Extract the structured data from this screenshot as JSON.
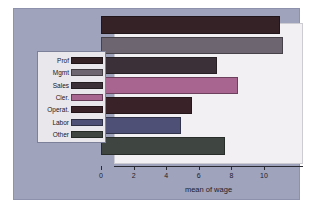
{
  "chart_data": {
    "type": "bar",
    "orientation": "horizontal",
    "title": "",
    "xlabel": "mean of wage",
    "ylabel": "",
    "xlim": [
      0,
      11.6
    ],
    "xticks": [
      0,
      2,
      4,
      6,
      8,
      10
    ],
    "xtick_labels": [
      "0",
      "2",
      "4",
      "6",
      "8",
      "10"
    ],
    "grid": false,
    "legend_position": "left-outside",
    "categories": [
      "Prof",
      "Mgmt",
      "Sales",
      "Cler.",
      "Operat.",
      "Labor",
      "Other"
    ],
    "values": [
      11.0,
      11.2,
      7.1,
      8.4,
      5.6,
      4.9,
      7.6
    ],
    "colors": [
      "#342227",
      "#6d6670",
      "#3b3038",
      "#a8658f",
      "#3a2229",
      "#4e5075",
      "#3f4641"
    ],
    "series": [
      {
        "name": "mean of wage",
        "values": [
          11.0,
          11.2,
          7.1,
          8.4,
          5.6,
          4.9,
          7.6
        ]
      }
    ]
  },
  "legend": {
    "items": [
      {
        "label": "Prof",
        "color": "#342227"
      },
      {
        "label": "Mgmt",
        "color": "#6d6670"
      },
      {
        "label": "Sales",
        "color": "#3b3038"
      },
      {
        "label": "Cler.",
        "color": "#a8658f"
      },
      {
        "label": "Operat.",
        "color": "#3a2229"
      },
      {
        "label": "Labor",
        "color": "#4e5075"
      },
      {
        "label": "Other",
        "color": "#3f4641"
      }
    ]
  },
  "axis": {
    "xlabel": "mean of wage",
    "ticks": [
      "0",
      "2",
      "4",
      "6",
      "8",
      "10"
    ]
  },
  "palette": {
    "figure_background": "#9fa3bb",
    "panel_background": "#f2f0f2",
    "legend_background": "#e9e7ec",
    "axis_color": "#2a2a33"
  }
}
